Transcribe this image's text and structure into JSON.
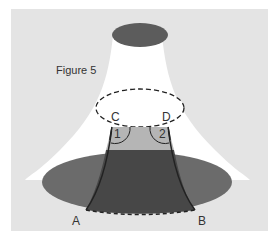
{
  "figure": {
    "title": "Figure 5",
    "points": {
      "a": "A",
      "b": "B",
      "c": "C",
      "d": "D"
    },
    "angles": {
      "one": "1",
      "two": "2"
    }
  },
  "colors": {
    "background": "#e4e4e4",
    "surface": "#ffffff",
    "dark_ellipse": "#6a6a6a",
    "top_ellipse": "#5c5c5c",
    "strip_light": "#b5b5b5",
    "strip_dark": "#484848"
  }
}
